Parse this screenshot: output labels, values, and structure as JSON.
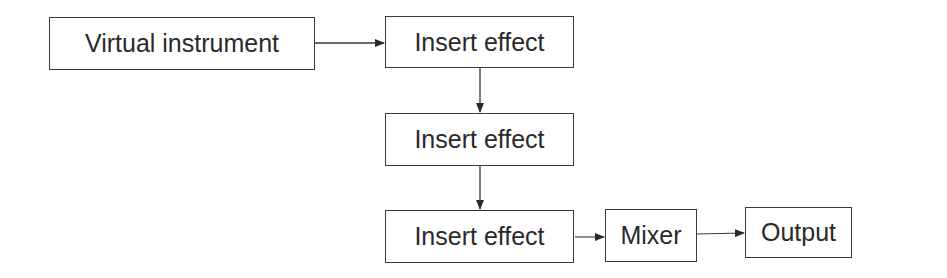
{
  "diagram": {
    "type": "flowchart",
    "nodes": [
      {
        "id": "virtual-instrument",
        "label": "Virtual instrument"
      },
      {
        "id": "insert-effect-1",
        "label": "Insert effect"
      },
      {
        "id": "insert-effect-2",
        "label": "Insert effect"
      },
      {
        "id": "insert-effect-3",
        "label": "Insert effect"
      },
      {
        "id": "mixer",
        "label": "Mixer"
      },
      {
        "id": "output",
        "label": "Output"
      }
    ],
    "edges": [
      {
        "from": "virtual-instrument",
        "to": "insert-effect-1"
      },
      {
        "from": "insert-effect-1",
        "to": "insert-effect-2"
      },
      {
        "from": "insert-effect-2",
        "to": "insert-effect-3"
      },
      {
        "from": "insert-effect-3",
        "to": "mixer"
      },
      {
        "from": "mixer",
        "to": "output"
      }
    ],
    "colors": {
      "stroke": "#3a3a3a",
      "text": "#2a2a2a",
      "background": "#ffffff"
    }
  }
}
